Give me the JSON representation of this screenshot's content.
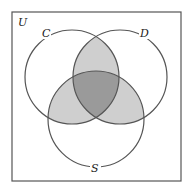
{
  "diagram": {
    "type": "venn-3-set",
    "universe_label": "U",
    "sets": [
      {
        "label": "C",
        "cx": 72,
        "cy": 77,
        "r": 47
      },
      {
        "label": "D",
        "cx": 120,
        "cy": 77,
        "r": 47
      },
      {
        "label": "S",
        "cx": 96,
        "cy": 119,
        "r": 48
      }
    ],
    "shaded_regions": [
      {
        "region": "C∩D only",
        "shade": "light"
      },
      {
        "region": "C∩S only",
        "shade": "light"
      },
      {
        "region": "D∩S only",
        "shade": "light"
      },
      {
        "region": "C∩D∩S",
        "shade": "dark"
      }
    ],
    "colors": {
      "background": "#ffffff",
      "frame": "#555555",
      "circle_stroke": "#555555",
      "light_shade": "#cfcfcf",
      "dark_shade": "#9a9a9a"
    }
  }
}
